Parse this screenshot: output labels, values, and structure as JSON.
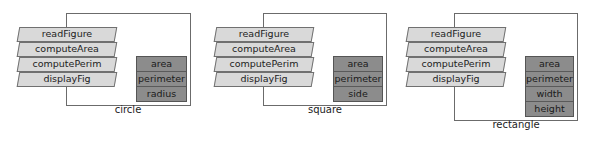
{
  "diagram": {
    "methods": [
      "readFigure",
      "computeArea",
      "computePerim",
      "displayFig"
    ],
    "objects": [
      {
        "name": "circle",
        "fields": [
          "area",
          "perimeter",
          "radius"
        ]
      },
      {
        "name": "square",
        "fields": [
          "area",
          "perimeter",
          "side"
        ]
      },
      {
        "name": "rectangle",
        "fields": [
          "area",
          "perimeter",
          "width",
          "height"
        ]
      }
    ],
    "colors": {
      "method_fill": "#d9d9d9",
      "data_fill": "#8c8c8c",
      "frame_border": "#6b6b6b"
    }
  }
}
